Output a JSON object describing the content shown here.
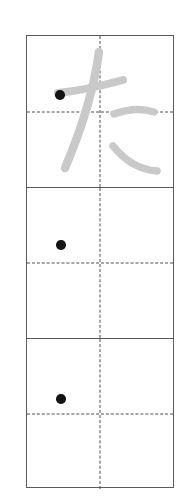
{
  "worksheet": {
    "title": "Hiragana writing practice grid",
    "script": "hiragana",
    "character": "た",
    "romaji": "ta",
    "stroke_count": 4,
    "cell_count": 3,
    "colors": {
      "page_background": "#ffffff",
      "grid_border": "#5a5a5a",
      "guide_line": "#4a4a55",
      "trace_stroke": "#c9c9c9",
      "start_dot": "#141414"
    },
    "cells": [
      {
        "index": 1,
        "name": "model-cell",
        "has_traced_character": true,
        "traced_character": "た",
        "has_start_dot": true,
        "start_dot_label": "stroke-1-start"
      },
      {
        "index": 2,
        "name": "practice-cell",
        "has_traced_character": false,
        "traced_character": "",
        "has_start_dot": true,
        "start_dot_label": "stroke-1-start"
      },
      {
        "index": 3,
        "name": "practice-cell",
        "has_traced_character": false,
        "traced_character": "",
        "has_start_dot": true,
        "start_dot_label": "stroke-1-start"
      }
    ],
    "guides": {
      "horizontal_label": "center-horizontal-dashed-guide",
      "vertical_label": "center-vertical-dashed-guide"
    }
  }
}
